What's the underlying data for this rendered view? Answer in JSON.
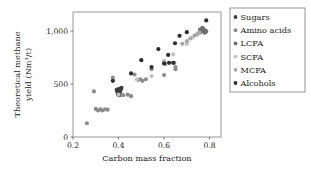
{
  "chart_data": {
    "type": "scatter",
    "title": "",
    "xlabel": "Carbon mass fraction",
    "ylabel": "Theoretical methane yield (Nm³/t)",
    "ylabel_line1": "Theoretical methane",
    "ylabel_line2": "yield (Nm³/t)",
    "xlim": [
      0.2,
      0.85
    ],
    "ylim": [
      0,
      1180
    ],
    "xticks": [
      0.2,
      0.4,
      0.6,
      0.8
    ],
    "xtick_labels": [
      "0.2",
      "0.4",
      "0.6",
      "0.8"
    ],
    "yticks": [
      0,
      500,
      1000
    ],
    "ytick_labels": [
      "0",
      "500",
      "1,000"
    ],
    "grid": false,
    "legend_position": "right-outside",
    "series": [
      {
        "name": "Sugars",
        "color": "#3b3b3b",
        "points": [
          [
            0.4,
            400
          ],
          [
            0.4,
            410
          ],
          [
            0.4,
            420
          ],
          [
            0.402,
            430
          ],
          [
            0.4,
            440
          ],
          [
            0.398,
            450
          ],
          [
            0.403,
            395
          ],
          [
            0.405,
            415
          ],
          [
            0.407,
            435
          ],
          [
            0.395,
            425
          ],
          [
            0.397,
            405
          ],
          [
            0.41,
            450
          ],
          [
            0.413,
            465
          ],
          [
            0.392,
            445
          ],
          [
            0.406,
            455
          ]
        ]
      },
      {
        "name": "Amino acids",
        "color": "#8c8c8c",
        "points": [
          [
            0.261,
            130
          ],
          [
            0.3,
            265
          ],
          [
            0.31,
            250
          ],
          [
            0.32,
            260
          ],
          [
            0.33,
            250
          ],
          [
            0.341,
            262
          ],
          [
            0.352,
            258
          ],
          [
            0.292,
            430
          ],
          [
            0.375,
            560
          ],
          [
            0.42,
            395
          ],
          [
            0.44,
            400
          ],
          [
            0.455,
            385
          ],
          [
            0.47,
            590
          ],
          [
            0.485,
            540
          ],
          [
            0.495,
            545
          ],
          [
            0.505,
            530
          ],
          [
            0.52,
            545
          ],
          [
            0.545,
            640
          ],
          [
            0.6,
            585
          ],
          [
            0.645,
            700
          ],
          [
            0.65,
            660
          ],
          [
            0.65,
            640
          ],
          [
            0.605,
            690
          ]
        ]
      },
      {
        "name": "LCFA",
        "color": "#6e6e6e",
        "points": [
          [
            0.76,
            990
          ],
          [
            0.765,
            1000
          ],
          [
            0.77,
            1010
          ],
          [
            0.772,
            1020
          ],
          [
            0.775,
            1000
          ],
          [
            0.778,
            985
          ],
          [
            0.768,
            1030
          ],
          [
            0.782,
            1005
          ],
          [
            0.758,
            1015
          ],
          [
            0.785,
            995
          ]
        ]
      },
      {
        "name": "SCFA",
        "color": "#c2c2c2",
        "points": [
          [
            0.4,
            400
          ],
          [
            0.48,
            545
          ],
          [
            0.545,
            575
          ],
          [
            0.6,
            720
          ],
          [
            0.64,
            780
          ],
          [
            0.7,
            880
          ],
          [
            0.725,
            940
          ],
          [
            0.745,
            965
          ]
        ]
      },
      {
        "name": "MCFA",
        "color": "#a8a8a8",
        "points": [
          [
            0.68,
            880
          ],
          [
            0.7,
            905
          ],
          [
            0.715,
            930
          ],
          [
            0.735,
            960
          ],
          [
            0.748,
            975
          ],
          [
            0.755,
            985
          ]
        ]
      },
      {
        "name": "Alcohols",
        "color": "#2e2e2e",
        "points": [
          [
            0.375,
            530
          ],
          [
            0.455,
            600
          ],
          [
            0.5,
            725
          ],
          [
            0.545,
            660
          ],
          [
            0.575,
            830
          ],
          [
            0.6,
            695
          ],
          [
            0.618,
            775
          ],
          [
            0.622,
            700
          ],
          [
            0.64,
            700
          ],
          [
            0.648,
            885
          ],
          [
            0.668,
            955
          ],
          [
            0.7,
            990
          ],
          [
            0.785,
            1100
          ]
        ]
      }
    ]
  },
  "legend": {
    "entries": [
      {
        "label": "Sugars",
        "color": "#3b3b3b"
      },
      {
        "label": "Amino acids",
        "color": "#8c8c8c"
      },
      {
        "label": "LCFA",
        "color": "#6e6e6e"
      },
      {
        "label": "SCFA",
        "color": "#c2c2c2"
      },
      {
        "label": "MCFA",
        "color": "#a8a8a8"
      },
      {
        "label": "Alcohols",
        "color": "#2e2e2e"
      }
    ]
  }
}
